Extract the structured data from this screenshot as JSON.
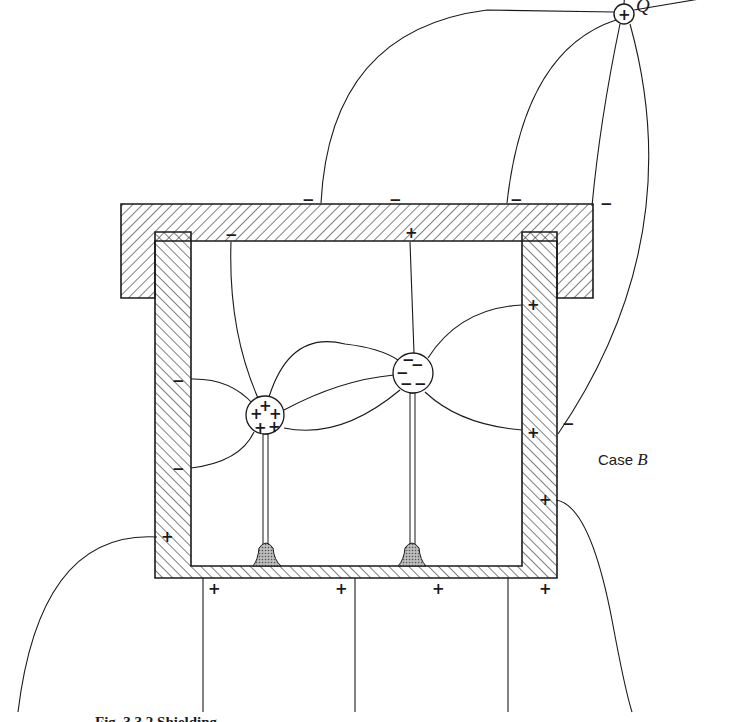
{
  "figure": {
    "external_charge": {
      "label": "Q",
      "sign": "+",
      "cx": 624,
      "cy": 14,
      "r": 10
    },
    "case_label": {
      "prefix": "Case",
      "letter": "B"
    },
    "caption_partial": "Fig. 3.3.2   Shielding...",
    "colors": {
      "ink": "#1a1a1a",
      "hatch": "#2a2a2a",
      "pedestal": "#8a8a8a",
      "background": "#ffffff"
    },
    "lid_signs": [
      {
        "sign": "−",
        "x": 309,
        "y": 204
      },
      {
        "sign": "−",
        "x": 396,
        "y": 204
      },
      {
        "sign": "−",
        "x": 517,
        "y": 204
      },
      {
        "sign": "−",
        "x": 607,
        "y": 208
      },
      {
        "sign": "−",
        "x": 231,
        "y": 239
      },
      {
        "sign": "+",
        "x": 411,
        "y": 236
      }
    ],
    "wall_signs": [
      {
        "sign": "−",
        "x": 178,
        "y": 385
      },
      {
        "sign": "−",
        "x": 178,
        "y": 473
      },
      {
        "sign": "+",
        "x": 167,
        "y": 541
      },
      {
        "sign": "+",
        "x": 533,
        "y": 309
      },
      {
        "sign": "+",
        "x": 533,
        "y": 433
      },
      {
        "sign": "−",
        "x": 568,
        "y": 428
      },
      {
        "sign": "+",
        "x": 545,
        "y": 504
      }
    ],
    "base_signs": [
      {
        "sign": "+",
        "x": 214,
        "y": 592
      },
      {
        "sign": "+",
        "x": 341,
        "y": 592
      },
      {
        "sign": "+",
        "x": 438,
        "y": 592
      },
      {
        "sign": "+",
        "x": 545,
        "y": 592
      }
    ],
    "sphere_positive": {
      "cx": 265,
      "cy": 415,
      "r": 19,
      "signs": [
        "+",
        "+",
        "+",
        "+",
        "+"
      ]
    },
    "sphere_negative": {
      "cx": 413,
      "cy": 373,
      "r": 20,
      "signs": [
        "−",
        "−",
        "−",
        "−",
        "−"
      ]
    }
  }
}
